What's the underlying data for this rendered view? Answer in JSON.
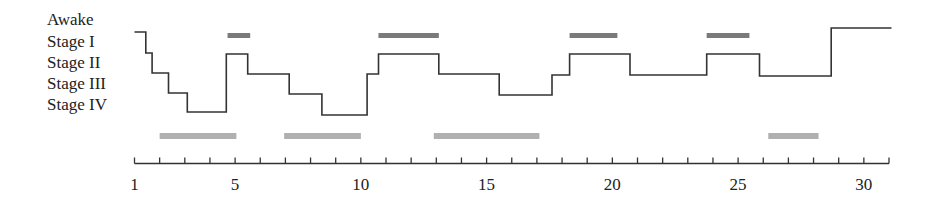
{
  "chart_data": {
    "type": "line",
    "subtype": "hypnogram-step",
    "title": "",
    "xlabel": "",
    "ylabel": "",
    "x_ticks": [
      1,
      2,
      3,
      4,
      5,
      6,
      7,
      8,
      9,
      10,
      11,
      12,
      13,
      14,
      15,
      16,
      17,
      18,
      19,
      20,
      21,
      22,
      23,
      24,
      25,
      26,
      27,
      28,
      29,
      30,
      31
    ],
    "x_tick_labels": [
      {
        "x": 1,
        "label": "1"
      },
      {
        "x": 5,
        "label": "5"
      },
      {
        "x": 10,
        "label": "10"
      },
      {
        "x": 15,
        "label": "15"
      },
      {
        "x": 20,
        "label": "20"
      },
      {
        "x": 25,
        "label": "25"
      },
      {
        "x": 30,
        "label": "30"
      }
    ],
    "xlim": [
      1,
      31
    ],
    "y_categories": [
      "Awake",
      "Stage I",
      "Stage II",
      "Stage III",
      "Stage IV"
    ],
    "y_pixel_levels": {
      "Awake": 28,
      "Stage I": 32,
      "Stage II": 54,
      "Stage III": 74,
      "Stage IV": 113
    },
    "series": [
      {
        "name": "sleep stage",
        "points": [
          {
            "x": 1.0,
            "y_px": 32
          },
          {
            "x": 1.45,
            "y_px": 32
          },
          {
            "x": 1.45,
            "y_px": 53
          },
          {
            "x": 1.7,
            "y_px": 53
          },
          {
            "x": 1.7,
            "y_px": 73
          },
          {
            "x": 2.35,
            "y_px": 73
          },
          {
            "x": 2.35,
            "y_px": 93
          },
          {
            "x": 3.1,
            "y_px": 93
          },
          {
            "x": 3.1,
            "y_px": 112
          },
          {
            "x": 4.65,
            "y_px": 112
          },
          {
            "x": 4.65,
            "y_px": 54
          },
          {
            "x": 5.5,
            "y_px": 54
          },
          {
            "x": 5.5,
            "y_px": 74
          },
          {
            "x": 7.15,
            "y_px": 74
          },
          {
            "x": 7.15,
            "y_px": 94
          },
          {
            "x": 8.45,
            "y_px": 94
          },
          {
            "x": 8.45,
            "y_px": 115
          },
          {
            "x": 10.25,
            "y_px": 115
          },
          {
            "x": 10.25,
            "y_px": 74
          },
          {
            "x": 10.7,
            "y_px": 74
          },
          {
            "x": 10.7,
            "y_px": 54
          },
          {
            "x": 13.1,
            "y_px": 54
          },
          {
            "x": 13.1,
            "y_px": 74
          },
          {
            "x": 15.5,
            "y_px": 74
          },
          {
            "x": 15.5,
            "y_px": 95
          },
          {
            "x": 17.6,
            "y_px": 95
          },
          {
            "x": 17.6,
            "y_px": 75
          },
          {
            "x": 18.3,
            "y_px": 75
          },
          {
            "x": 18.3,
            "y_px": 54
          },
          {
            "x": 20.7,
            "y_px": 54
          },
          {
            "x": 20.7,
            "y_px": 75
          },
          {
            "x": 23.75,
            "y_px": 75
          },
          {
            "x": 23.75,
            "y_px": 54
          },
          {
            "x": 25.85,
            "y_px": 54
          },
          {
            "x": 25.85,
            "y_px": 76
          },
          {
            "x": 28.7,
            "y_px": 76
          },
          {
            "x": 28.7,
            "y_px": 28
          },
          {
            "x": 31.1,
            "y_px": 28
          }
        ]
      }
    ],
    "top_bars_dark": [
      {
        "x_start": 4.7,
        "x_end": 5.6
      },
      {
        "x_start": 10.7,
        "x_end": 13.1
      },
      {
        "x_start": 18.3,
        "x_end": 20.2
      },
      {
        "x_start": 23.75,
        "x_end": 25.45
      }
    ],
    "bottom_bars_light": [
      {
        "x_start": 2.0,
        "x_end": 5.05
      },
      {
        "x_start": 6.95,
        "x_end": 10.0
      },
      {
        "x_start": 12.9,
        "x_end": 17.1
      },
      {
        "x_start": 26.2,
        "x_end": 28.2
      }
    ],
    "colors": {
      "line": "#333333",
      "top_bars": "#7a7a7a",
      "bottom_bars": "#b0b0b0",
      "axis": "#333333"
    },
    "grid": false,
    "legend": null
  }
}
